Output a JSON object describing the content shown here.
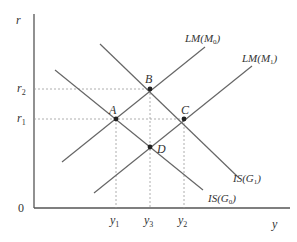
{
  "diagram": {
    "type": "IS-LM diagram",
    "axes": {
      "y_label": "r",
      "x_label": "y",
      "origin_label": "0",
      "y_ticks": [
        {
          "label": "r",
          "sub": "2"
        },
        {
          "label": "r",
          "sub": "1"
        }
      ],
      "x_ticks": [
        {
          "label": "y",
          "sub": "1"
        },
        {
          "label": "y",
          "sub": "3"
        },
        {
          "label": "y",
          "sub": "2"
        }
      ]
    },
    "curves": [
      {
        "id": "LM0",
        "label": "LM(M",
        "sub": "0",
        "close": ")"
      },
      {
        "id": "LM1",
        "label": "LM(M",
        "sub": "1",
        "close": ")"
      },
      {
        "id": "IS1",
        "label": "IS(G",
        "sub": "1",
        "close": ")"
      },
      {
        "id": "IS0",
        "label": "IS(G",
        "sub": "0",
        "close": ")"
      }
    ],
    "points": [
      {
        "label": "A"
      },
      {
        "label": "B"
      },
      {
        "label": "C"
      },
      {
        "label": "D"
      }
    ]
  }
}
